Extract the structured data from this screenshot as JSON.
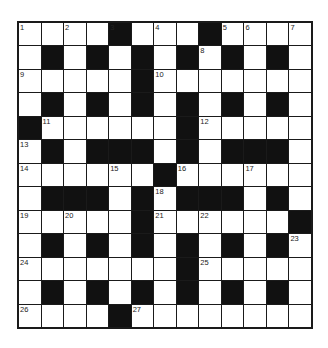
{
  "puzzle": {
    "type": "crossword",
    "rows": 13,
    "cols": 13,
    "colors": {
      "black_square": "#111111",
      "white_square": "#ffffff",
      "grid_line": "#1a1a1a"
    },
    "layout": [
      "....#...#....",
      ".#.#.#.#.#.#.",
      ".....#.......",
      ".#.#.#.#.#.#.",
      "#......#.....",
      ".#.###.#.###.",
      "......#......",
      ".###.#.###.#.",
      ".....#......#",
      ".#.#.#.#.#.#.",
      ".......#.....",
      ".#.#.#.#.#.#.",
      "....#........"
    ],
    "numbers": [
      {
        "row": 0,
        "col": 0,
        "n": "1"
      },
      {
        "row": 0,
        "col": 2,
        "n": "2"
      },
      {
        "row": 0,
        "col": 4,
        "n": "3"
      },
      {
        "row": 0,
        "col": 6,
        "n": "4"
      },
      {
        "row": 0,
        "col": 9,
        "n": "5"
      },
      {
        "row": 0,
        "col": 10,
        "n": "6"
      },
      {
        "row": 0,
        "col": 12,
        "n": "7"
      },
      {
        "row": 1,
        "col": 8,
        "n": "8"
      },
      {
        "row": 2,
        "col": 0,
        "n": "9"
      },
      {
        "row": 2,
        "col": 6,
        "n": "10"
      },
      {
        "row": 4,
        "col": 1,
        "n": "11"
      },
      {
        "row": 4,
        "col": 8,
        "n": "12"
      },
      {
        "row": 5,
        "col": 0,
        "n": "13"
      },
      {
        "row": 6,
        "col": 0,
        "n": "14"
      },
      {
        "row": 6,
        "col": 4,
        "n": "15"
      },
      {
        "row": 6,
        "col": 7,
        "n": "16"
      },
      {
        "row": 6,
        "col": 10,
        "n": "17"
      },
      {
        "row": 7,
        "col": 6,
        "n": "18"
      },
      {
        "row": 8,
        "col": 0,
        "n": "19"
      },
      {
        "row": 8,
        "col": 2,
        "n": "20"
      },
      {
        "row": 8,
        "col": 6,
        "n": "21"
      },
      {
        "row": 8,
        "col": 8,
        "n": "22"
      },
      {
        "row": 9,
        "col": 12,
        "n": "23"
      },
      {
        "row": 10,
        "col": 0,
        "n": "24"
      },
      {
        "row": 10,
        "col": 8,
        "n": "25"
      },
      {
        "row": 12,
        "col": 0,
        "n": "26"
      },
      {
        "row": 12,
        "col": 5,
        "n": "27"
      }
    ]
  }
}
